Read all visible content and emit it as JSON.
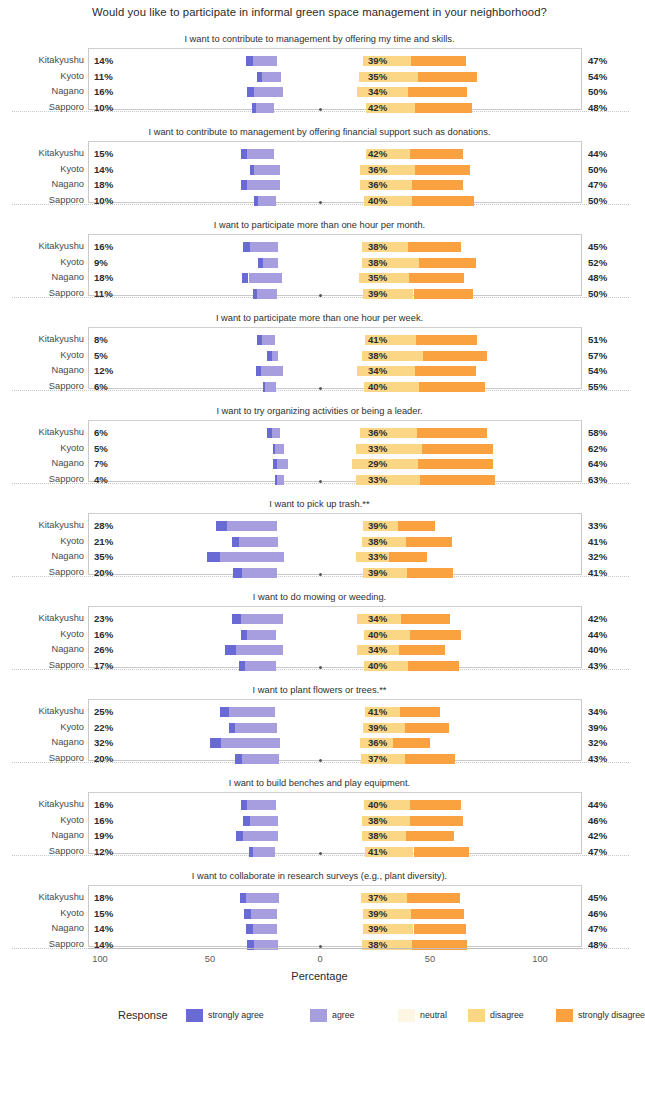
{
  "title": "Would you like to participate in informal green space management in your neighborhood?",
  "axis": {
    "title": "Percentage",
    "ticks": [
      "100",
      "50",
      "0",
      "50",
      "100"
    ],
    "tick_values": [
      -100,
      -50,
      0,
      50,
      100
    ]
  },
  "legend": {
    "title": "Response",
    "items": [
      {
        "label": "strongly agree",
        "color": "#6a6ad4"
      },
      {
        "label": "agree",
        "color": "#a79ee0"
      },
      {
        "label": "neutral",
        "color": "#fdf6e3"
      },
      {
        "label": "disagree",
        "color": "#fbd684"
      },
      {
        "label": "strongly disagree",
        "color": "#f9a23f"
      }
    ]
  },
  "cities": [
    "Kitakyushu",
    "Kyoto",
    "Nagano",
    "Sapporo"
  ],
  "chart_data": {
    "type": "bar",
    "subtype": "diverging-stacked-likert",
    "title": "Would you like to participate in informal green space management in your neighborhood?",
    "xlabel": "Percentage",
    "ylabel": "",
    "xlim": [
      -100,
      100
    ],
    "xticks": [
      -100,
      -50,
      0,
      50,
      100
    ],
    "xticklabels": [
      "100",
      "50",
      "0",
      "50",
      "100"
    ],
    "grid": false,
    "legend_position": "bottom",
    "categories": [
      "Kitakyushu",
      "Kyoto",
      "Nagano",
      "Sapporo"
    ],
    "response_levels": [
      "strongly agree",
      "agree",
      "neutral",
      "disagree",
      "strongly disagree"
    ],
    "colors": [
      "#6a6ad4",
      "#a79ee0",
      "#fdf6e3",
      "#fbd684",
      "#f9a23f"
    ],
    "panels": [
      {
        "title": "I want to contribute to management by offering my time and skills.",
        "rows": [
          {
            "city": "Kitakyushu",
            "agree_total": 14,
            "neutral": 39,
            "disagree_total": 47,
            "strongly_agree": 3,
            "agree": 11,
            "disagree": 22,
            "strongly_disagree": 25
          },
          {
            "city": "Kyoto",
            "agree_total": 11,
            "neutral": 35,
            "disagree_total": 54,
            "strongly_agree": 2,
            "agree": 9,
            "disagree": 27,
            "strongly_disagree": 27
          },
          {
            "city": "Nagano",
            "agree_total": 16,
            "neutral": 34,
            "disagree_total": 50,
            "strongly_agree": 3,
            "agree": 13,
            "disagree": 23,
            "strongly_disagree": 27
          },
          {
            "city": "Sapporo",
            "agree_total": 10,
            "neutral": 42,
            "disagree_total": 48,
            "strongly_agree": 2,
            "agree": 8,
            "disagree": 22,
            "strongly_disagree": 26
          }
        ]
      },
      {
        "title": "I want to contribute to management by offering financial support such as donations.",
        "rows": [
          {
            "city": "Kitakyushu",
            "agree_total": 15,
            "neutral": 42,
            "disagree_total": 44,
            "strongly_agree": 3,
            "agree": 12,
            "disagree": 20,
            "strongly_disagree": 24
          },
          {
            "city": "Kyoto",
            "agree_total": 14,
            "neutral": 36,
            "disagree_total": 50,
            "strongly_agree": 2,
            "agree": 12,
            "disagree": 25,
            "strongly_disagree": 25
          },
          {
            "city": "Nagano",
            "agree_total": 18,
            "neutral": 36,
            "disagree_total": 47,
            "strongly_agree": 3,
            "agree": 15,
            "disagree": 24,
            "strongly_disagree": 23
          },
          {
            "city": "Sapporo",
            "agree_total": 10,
            "neutral": 40,
            "disagree_total": 50,
            "strongly_agree": 2,
            "agree": 8,
            "disagree": 22,
            "strongly_disagree": 28
          }
        ]
      },
      {
        "title": "I want to participate more than one hour per month.",
        "rows": [
          {
            "city": "Kitakyushu",
            "agree_total": 16,
            "neutral": 38,
            "disagree_total": 45,
            "strongly_agree": 3,
            "agree": 13,
            "disagree": 21,
            "strongly_disagree": 24
          },
          {
            "city": "Kyoto",
            "agree_total": 9,
            "neutral": 38,
            "disagree_total": 52,
            "strongly_agree": 2,
            "agree": 7,
            "disagree": 26,
            "strongly_disagree": 26
          },
          {
            "city": "Nagano",
            "agree_total": 18,
            "neutral": 35,
            "disagree_total": 48,
            "strongly_agree": 3,
            "agree": 15,
            "disagree": 23,
            "strongly_disagree": 25
          },
          {
            "city": "Sapporo",
            "agree_total": 11,
            "neutral": 39,
            "disagree_total": 50,
            "strongly_agree": 2,
            "agree": 9,
            "disagree": 23,
            "strongly_disagree": 27
          }
        ]
      },
      {
        "title": "I want to participate more than one hour per week.",
        "rows": [
          {
            "city": "Kitakyushu",
            "agree_total": 8,
            "neutral": 41,
            "disagree_total": 51,
            "strongly_agree": 2,
            "agree": 6,
            "disagree": 23,
            "strongly_disagree": 28
          },
          {
            "city": "Kyoto",
            "agree_total": 5,
            "neutral": 38,
            "disagree_total": 57,
            "strongly_agree": 2,
            "agree": 3,
            "disagree": 28,
            "strongly_disagree": 29
          },
          {
            "city": "Nagano",
            "agree_total": 12,
            "neutral": 34,
            "disagree_total": 54,
            "strongly_agree": 2,
            "agree": 10,
            "disagree": 26,
            "strongly_disagree": 28
          },
          {
            "city": "Sapporo",
            "agree_total": 6,
            "neutral": 40,
            "disagree_total": 55,
            "strongly_agree": 1,
            "agree": 5,
            "disagree": 25,
            "strongly_disagree": 30
          }
        ]
      },
      {
        "title": "I want to try organizing activities or being a leader.",
        "rows": [
          {
            "city": "Kitakyushu",
            "agree_total": 6,
            "neutral": 36,
            "disagree_total": 58,
            "strongly_agree": 2,
            "agree": 4,
            "disagree": 26,
            "strongly_disagree": 32
          },
          {
            "city": "Kyoto",
            "agree_total": 5,
            "neutral": 33,
            "disagree_total": 62,
            "strongly_agree": 1,
            "agree": 4,
            "disagree": 30,
            "strongly_disagree": 32
          },
          {
            "city": "Nagano",
            "agree_total": 7,
            "neutral": 29,
            "disagree_total": 64,
            "strongly_agree": 2,
            "agree": 5,
            "disagree": 30,
            "strongly_disagree": 34
          },
          {
            "city": "Sapporo",
            "agree_total": 4,
            "neutral": 33,
            "disagree_total": 63,
            "strongly_agree": 1,
            "agree": 3,
            "disagree": 29,
            "strongly_disagree": 34
          }
        ]
      },
      {
        "title": "I want to pick up trash.**",
        "rows": [
          {
            "city": "Kitakyushu",
            "agree_total": 28,
            "neutral": 39,
            "disagree_total": 33,
            "strongly_agree": 5,
            "agree": 23,
            "disagree": 16,
            "strongly_disagree": 17
          },
          {
            "city": "Kyoto",
            "agree_total": 21,
            "neutral": 38,
            "disagree_total": 41,
            "strongly_agree": 3,
            "agree": 18,
            "disagree": 20,
            "strongly_disagree": 21
          },
          {
            "city": "Nagano",
            "agree_total": 35,
            "neutral": 33,
            "disagree_total": 32,
            "strongly_agree": 6,
            "agree": 29,
            "disagree": 15,
            "strongly_disagree": 17
          },
          {
            "city": "Sapporo",
            "agree_total": 20,
            "neutral": 39,
            "disagree_total": 41,
            "strongly_agree": 4,
            "agree": 16,
            "disagree": 20,
            "strongly_disagree": 21
          }
        ]
      },
      {
        "title": "I want to do mowing or weeding.",
        "rows": [
          {
            "city": "Kitakyushu",
            "agree_total": 23,
            "neutral": 34,
            "disagree_total": 42,
            "strongly_agree": 4,
            "agree": 19,
            "disagree": 20,
            "strongly_disagree": 22
          },
          {
            "city": "Kyoto",
            "agree_total": 16,
            "neutral": 40,
            "disagree_total": 44,
            "strongly_agree": 3,
            "agree": 13,
            "disagree": 21,
            "strongly_disagree": 23
          },
          {
            "city": "Nagano",
            "agree_total": 26,
            "neutral": 34,
            "disagree_total": 40,
            "strongly_agree": 5,
            "agree": 21,
            "disagree": 19,
            "strongly_disagree": 21
          },
          {
            "city": "Sapporo",
            "agree_total": 17,
            "neutral": 40,
            "disagree_total": 43,
            "strongly_agree": 3,
            "agree": 14,
            "disagree": 20,
            "strongly_disagree": 23
          }
        ]
      },
      {
        "title": "I want to plant flowers or trees.**",
        "rows": [
          {
            "city": "Kitakyushu",
            "agree_total": 25,
            "neutral": 41,
            "disagree_total": 34,
            "strongly_agree": 4,
            "agree": 21,
            "disagree": 16,
            "strongly_disagree": 18
          },
          {
            "city": "Kyoto",
            "agree_total": 22,
            "neutral": 39,
            "disagree_total": 39,
            "strongly_agree": 3,
            "agree": 19,
            "disagree": 19,
            "strongly_disagree": 20
          },
          {
            "city": "Nagano",
            "agree_total": 32,
            "neutral": 36,
            "disagree_total": 32,
            "strongly_agree": 5,
            "agree": 27,
            "disagree": 15,
            "strongly_disagree": 17
          },
          {
            "city": "Sapporo",
            "agree_total": 20,
            "neutral": 37,
            "disagree_total": 43,
            "strongly_agree": 3,
            "agree": 17,
            "disagree": 20,
            "strongly_disagree": 23
          }
        ]
      },
      {
        "title": "I want to build benches and play equipment.",
        "rows": [
          {
            "city": "Kitakyushu",
            "agree_total": 16,
            "neutral": 40,
            "disagree_total": 44,
            "strongly_agree": 3,
            "agree": 13,
            "disagree": 21,
            "strongly_disagree": 23
          },
          {
            "city": "Kyoto",
            "agree_total": 16,
            "neutral": 38,
            "disagree_total": 46,
            "strongly_agree": 3,
            "agree": 13,
            "disagree": 22,
            "strongly_disagree": 24
          },
          {
            "city": "Nagano",
            "agree_total": 19,
            "neutral": 38,
            "disagree_total": 42,
            "strongly_agree": 3,
            "agree": 16,
            "disagree": 20,
            "strongly_disagree": 22
          },
          {
            "city": "Sapporo",
            "agree_total": 12,
            "neutral": 41,
            "disagree_total": 47,
            "strongly_agree": 2,
            "agree": 10,
            "disagree": 22,
            "strongly_disagree": 25
          }
        ]
      },
      {
        "title": "I want to collaborate in research surveys (e.g., plant diversity).",
        "rows": [
          {
            "city": "Kitakyushu",
            "agree_total": 18,
            "neutral": 37,
            "disagree_total": 45,
            "strongly_agree": 3,
            "agree": 15,
            "disagree": 21,
            "strongly_disagree": 24
          },
          {
            "city": "Kyoto",
            "agree_total": 15,
            "neutral": 39,
            "disagree_total": 46,
            "strongly_agree": 3,
            "agree": 12,
            "disagree": 22,
            "strongly_disagree": 24
          },
          {
            "city": "Nagano",
            "agree_total": 14,
            "neutral": 39,
            "disagree_total": 47,
            "strongly_agree": 3,
            "agree": 11,
            "disagree": 23,
            "strongly_disagree": 24
          },
          {
            "city": "Sapporo",
            "agree_total": 14,
            "neutral": 38,
            "disagree_total": 48,
            "strongly_agree": 3,
            "agree": 11,
            "disagree": 23,
            "strongly_disagree": 25
          }
        ]
      }
    ]
  }
}
